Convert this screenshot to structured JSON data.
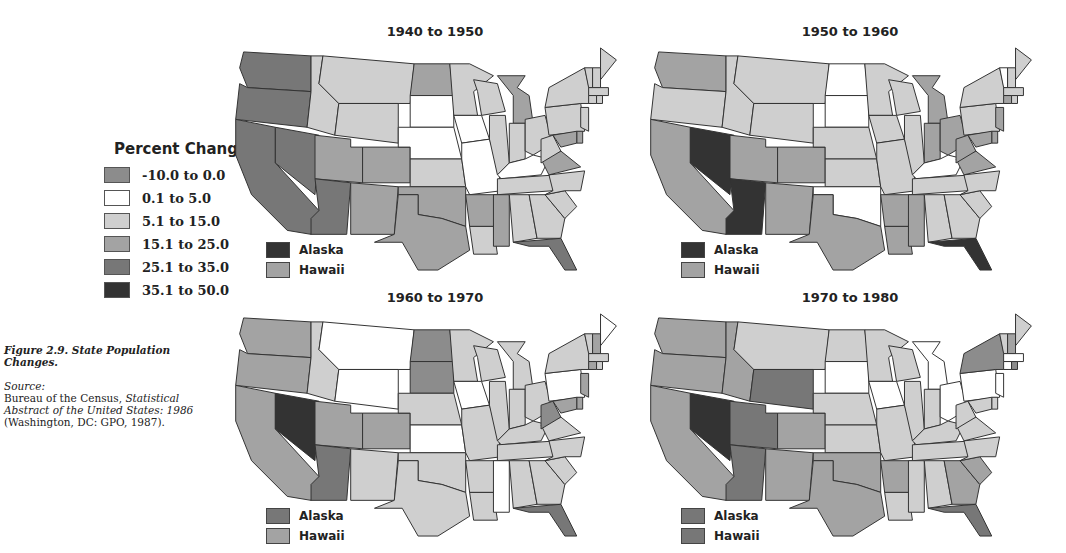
{
  "legend": {
    "title": "Percent Change",
    "items": [
      {
        "key": "a",
        "label": "-10.0 to 0.0",
        "color": "#8c8c8c"
      },
      {
        "key": "b",
        "label": "0.1 to 5.0",
        "color": "#ffffff"
      },
      {
        "key": "c",
        "label": "5.1 to 15.0",
        "color": "#cfcfcf"
      },
      {
        "key": "d",
        "label": "15.1 to 25.0",
        "color": "#a3a3a3"
      },
      {
        "key": "e",
        "label": "25.1 to 35.0",
        "color": "#777777"
      },
      {
        "key": "f",
        "label": "35.1 to 50.0",
        "color": "#333333"
      }
    ]
  },
  "caption": {
    "title": "Figure 2.9.  State Population Changes.",
    "source_label": "Source:",
    "source_plain": "Bureau of the Census, ",
    "source_italic": "Statistical Abstract of the United States: 1986",
    "source_tail": "(Washington, DC: GPO, 1987)."
  },
  "chart_data": {
    "type": "choropleth",
    "title": "State Population Changes",
    "legend_position": "left",
    "bins": [
      "-10.0 to 0.0",
      "0.1 to 5.0",
      "5.1 to 15.0",
      "15.1 to 25.0",
      "25.1 to 35.0",
      "35.1 to 50.0"
    ],
    "maps": [
      {
        "title": "1940 to 1950",
        "alaska": "35.1 to 50.0",
        "hawaii": "15.1 to 25.0",
        "states": {
          "WA": "e",
          "OR": "e",
          "CA": "e",
          "NV": "e",
          "ID": "c",
          "MT": "c",
          "WY": "c",
          "UT": "d",
          "CO": "d",
          "AZ": "e",
          "NM": "d",
          "ND": "d",
          "SD": "b",
          "NE": "b",
          "KS": "c",
          "OK": "d",
          "TX": "d",
          "MN": "c",
          "IA": "b",
          "MO": "b",
          "AR": "d",
          "LA": "c",
          "WI": "c",
          "IL": "c",
          "MI": "d",
          "IN": "c",
          "OH": "c",
          "KY": "b",
          "TN": "c",
          "MS": "d",
          "AL": "c",
          "GA": "c",
          "FL": "e",
          "SC": "c",
          "NC": "c",
          "VA": "d",
          "WV": "c",
          "PA": "c",
          "NY": "c",
          "ME": "c",
          "VT": "c",
          "NH": "c",
          "MA": "c",
          "CT": "c",
          "RI": "c",
          "NJ": "c",
          "DE": "d",
          "MD": "d"
        }
      },
      {
        "title": "1950 to 1960",
        "alaska": "35.1 to 50.0",
        "hawaii": "15.1 to 25.0",
        "states": {
          "WA": "d",
          "OR": "c",
          "CA": "d",
          "NV": "f",
          "ID": "c",
          "MT": "c",
          "WY": "c",
          "UT": "d",
          "CO": "d",
          "AZ": "f",
          "NM": "d",
          "ND": "b",
          "SD": "b",
          "NE": "c",
          "KS": "c",
          "OK": "b",
          "TX": "d",
          "MN": "c",
          "IA": "c",
          "MO": "c",
          "AR": "d",
          "LA": "d",
          "WI": "c",
          "IL": "c",
          "MI": "d",
          "IN": "d",
          "OH": "d",
          "KY": "b",
          "TN": "c",
          "MS": "d",
          "AL": "c",
          "GA": "c",
          "FL": "f",
          "SC": "c",
          "NC": "c",
          "VA": "d",
          "WV": "d",
          "PA": "c",
          "NY": "c",
          "ME": "c",
          "VT": "b",
          "NH": "c",
          "MA": "c",
          "CT": "d",
          "RI": "c",
          "NJ": "d",
          "DE": "d",
          "MD": "d"
        }
      },
      {
        "title": "1960 to 1970",
        "alaska": "25.1 to 35.0",
        "hawaii": "15.1 to 25.0",
        "states": {
          "WA": "d",
          "OR": "d",
          "CA": "d",
          "NV": "f",
          "ID": "c",
          "MT": "b",
          "WY": "b",
          "UT": "d",
          "CO": "d",
          "AZ": "e",
          "NM": "c",
          "ND": "a",
          "SD": "a",
          "NE": "c",
          "KS": "b",
          "OK": "c",
          "TX": "c",
          "MN": "c",
          "IA": "b",
          "MO": "c",
          "AR": "c",
          "LA": "c",
          "WI": "c",
          "IL": "c",
          "MI": "c",
          "IN": "c",
          "OH": "c",
          "KY": "c",
          "TN": "c",
          "MS": "b",
          "AL": "c",
          "GA": "c",
          "FL": "e",
          "SC": "c",
          "NC": "c",
          "VA": "c",
          "WV": "a",
          "PA": "b",
          "NY": "c",
          "ME": "b",
          "VT": "c",
          "NH": "d",
          "MA": "c",
          "CT": "d",
          "RI": "c",
          "NJ": "d",
          "DE": "d",
          "MD": "d"
        }
      },
      {
        "title": "1970 to 1980",
        "alaska": "25.1 to 35.0",
        "hawaii": "25.1 to 35.0",
        "states": {
          "WA": "d",
          "OR": "d",
          "CA": "d",
          "NV": "f",
          "ID": "d",
          "MT": "c",
          "WY": "e",
          "UT": "e",
          "CO": "d",
          "AZ": "e",
          "NM": "d",
          "ND": "c",
          "SD": "b",
          "NE": "c",
          "KS": "c",
          "OK": "d",
          "TX": "d",
          "MN": "c",
          "IA": "b",
          "MO": "c",
          "AR": "d",
          "LA": "c",
          "WI": "c",
          "IL": "c",
          "MI": "b",
          "IN": "c",
          "OH": "b",
          "KY": "c",
          "TN": "c",
          "MS": "c",
          "AL": "c",
          "GA": "d",
          "FL": "e",
          "SC": "d",
          "NC": "c",
          "VA": "c",
          "WV": "c",
          "PA": "b",
          "NY": "a",
          "ME": "c",
          "VT": "c",
          "NH": "d",
          "MA": "b",
          "CT": "b",
          "RI": "a",
          "NJ": "b",
          "DE": "c",
          "MD": "c"
        }
      }
    ]
  },
  "maps_text": [
    {
      "title": "1940 to 1950",
      "alaska_label": "Alaska",
      "hawaii_label": "Hawaii"
    },
    {
      "title": "1950 to 1960",
      "alaska_label": "Alaska",
      "hawaii_label": "Hawaii"
    },
    {
      "title": "1960 to 1970",
      "alaska_label": "Alaska",
      "hawaii_label": "Hawaii"
    },
    {
      "title": "1970 to 1980",
      "alaska_label": "Alaska",
      "hawaii_label": "Hawaii"
    }
  ]
}
